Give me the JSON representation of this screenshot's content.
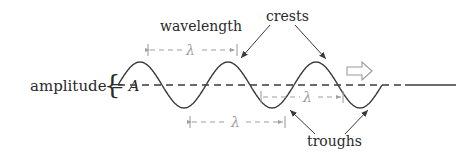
{
  "diagram": {
    "labels": {
      "wavelength": "wavelength",
      "crests": "crests",
      "troughs": "troughs",
      "amplitude": "amplitude = ",
      "amplitude_symbol": "A",
      "brace": "{",
      "lambda": "λ",
      "direction_arrow": "⇒"
    },
    "colors": {
      "wave": "#3a3a3a",
      "baseline": "#3a3a3a",
      "measure": "#a0a0a0",
      "text": "#2a2a2a",
      "pointer": "#3a3a3a"
    },
    "wave": {
      "cycles_shown": 3,
      "crest_count": 3,
      "trough_count": 3,
      "direction": "right"
    }
  }
}
